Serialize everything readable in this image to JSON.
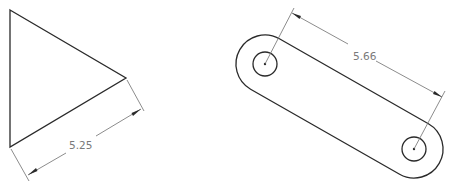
{
  "figures": [
    {
      "name": "triangle",
      "dimension": {
        "label": "5.25"
      }
    },
    {
      "name": "slotted-link",
      "dimension": {
        "label": "5.66"
      }
    }
  ],
  "colors": {
    "outline": "#2a2a2a",
    "dimension_line": "#6e6e6e",
    "dimension_text": "#7a7a7a",
    "background": "#ffffff"
  }
}
